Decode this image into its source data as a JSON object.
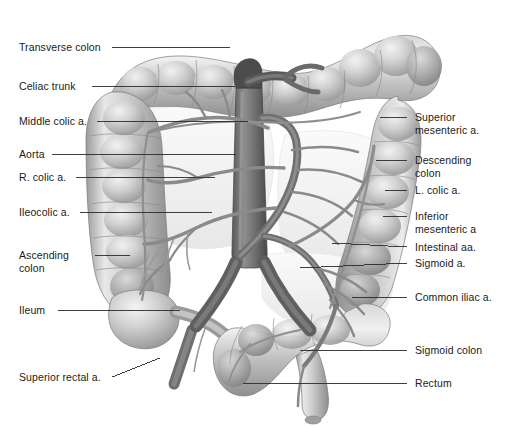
{
  "figure": {
    "background_color": "#ffffff",
    "text_color": "#1a1a1a",
    "leader_color": "#2b2b2b",
    "width": 509,
    "height": 429
  },
  "labels_left": [
    {
      "id": "transverse-colon",
      "text": "Transverse colon",
      "x": 19,
      "y": 41
    },
    {
      "id": "celiac-trunk",
      "text": "Celiac trunk",
      "x": 19,
      "y": 80
    },
    {
      "id": "middle-colic-a",
      "text": "Middle colic a.",
      "x": 19,
      "y": 115
    },
    {
      "id": "aorta",
      "text": "Aorta",
      "x": 19,
      "y": 148
    },
    {
      "id": "r-colic-a",
      "text": "R. colic a.",
      "x": 19,
      "y": 171
    },
    {
      "id": "ileocolic-a",
      "text": "Ileocolic a.",
      "x": 19,
      "y": 206
    },
    {
      "id": "ascending-colon",
      "text": "Ascending\ncolon",
      "x": 19,
      "y": 249
    },
    {
      "id": "ileum",
      "text": "Ileum",
      "x": 19,
      "y": 304
    },
    {
      "id": "superior-rectal-a",
      "text": "Superior rectal a.",
      "x": 19,
      "y": 371
    }
  ],
  "labels_right": [
    {
      "id": "superior-mesenteric-a",
      "text": "Superior\nmesenteric a.",
      "x": 415,
      "y": 111
    },
    {
      "id": "descending-colon",
      "text": "Descending\ncolon",
      "x": 415,
      "y": 154
    },
    {
      "id": "l-colic-a",
      "text": "L. colic a.",
      "x": 415,
      "y": 184
    },
    {
      "id": "inferior-mesenteric-a",
      "text": "Inferior\nmesenteric a",
      "x": 415,
      "y": 210
    },
    {
      "id": "intestinal-aa",
      "text": "Intestinal aa.",
      "x": 415,
      "y": 241
    },
    {
      "id": "sigmoid-a",
      "text": "Sigmoid a.",
      "x": 415,
      "y": 257
    },
    {
      "id": "common-iliac-a",
      "text": "Common iliac a.",
      "x": 415,
      "y": 291
    },
    {
      "id": "sigmoid-colon",
      "text": "Sigmoid colon",
      "x": 415,
      "y": 344
    },
    {
      "id": "rectum",
      "text": "Rectum",
      "x": 415,
      "y": 377
    }
  ],
  "leader_lines": [
    {
      "id": "leader-transverse-colon",
      "points": "112,47 230,47"
    },
    {
      "id": "leader-celiac-trunk",
      "points": "92,86 235,86"
    },
    {
      "id": "leader-middle-colic-a",
      "points": "97,121 248,121"
    },
    {
      "id": "leader-aorta",
      "points": "52,154 236,154"
    },
    {
      "id": "leader-r-colic-a",
      "points": "76,177 215,177"
    },
    {
      "id": "leader-ileocolic-a",
      "points": "80,212 212,212"
    },
    {
      "id": "leader-ascending-colon",
      "points": "95,255 130,255"
    },
    {
      "id": "leader-ileum",
      "points": "58,310 180,310"
    },
    {
      "id": "leader-superior-rectal-a",
      "points": "112,377 160,358"
    },
    {
      "id": "leader-superior-mesenteric-a",
      "points": "380,117 407,117"
    },
    {
      "id": "leader-descending-colon",
      "points": "376,160 407,160"
    },
    {
      "id": "leader-l-colic-a",
      "points": "385,190 407,190"
    },
    {
      "id": "leader-inferior-mesenteric-a",
      "points": "383,216 407,216"
    },
    {
      "id": "leader-intestinal-aa",
      "points": "332,243 407,247"
    },
    {
      "id": "leader-sigmoid-a",
      "points": "300,268 407,263"
    },
    {
      "id": "leader-common-iliac-a",
      "points": "352,297 407,297"
    },
    {
      "id": "leader-sigmoid-colon",
      "points": "300,350 407,350"
    },
    {
      "id": "leader-rectum",
      "points": "243,383 407,383"
    }
  ],
  "anatomy_parts": [
    "transverse-colon",
    "ascending-colon",
    "descending-colon",
    "sigmoid-colon",
    "rectum",
    "ileum",
    "cecum",
    "aorta",
    "celiac-trunk",
    "superior-mesenteric-artery",
    "inferior-mesenteric-artery",
    "middle-colic-artery",
    "right-colic-artery",
    "ileocolic-artery",
    "left-colic-artery",
    "sigmoid-artery",
    "superior-rectal-artery",
    "common-iliac-artery",
    "intestinal-arteries"
  ]
}
